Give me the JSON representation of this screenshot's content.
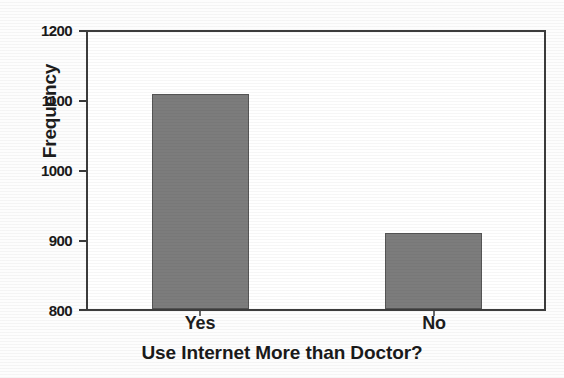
{
  "chart_data": {
    "type": "bar",
    "title": "",
    "subtitle": "",
    "xlabel": "Use Internet More than Doctor?",
    "ylabel": "Frequency",
    "categories": [
      "Yes",
      "No"
    ],
    "values": [
      1110,
      910
    ],
    "ylim": [
      800,
      1200
    ],
    "yticks": [
      800,
      900,
      1000,
      1100,
      1200
    ],
    "ytick_labels": [
      "800",
      "900",
      "1000",
      "1100",
      "1200"
    ],
    "xtick_labels": [
      "Yes",
      "No"
    ],
    "grid": false,
    "legend": false,
    "legend_position": "none",
    "bar_color": "#7c7c7c",
    "bar_edge_color": "#555555",
    "axis_color": "#3c3c3c",
    "text_color": "#1a1a1a",
    "background_color": "#ffffff"
  }
}
